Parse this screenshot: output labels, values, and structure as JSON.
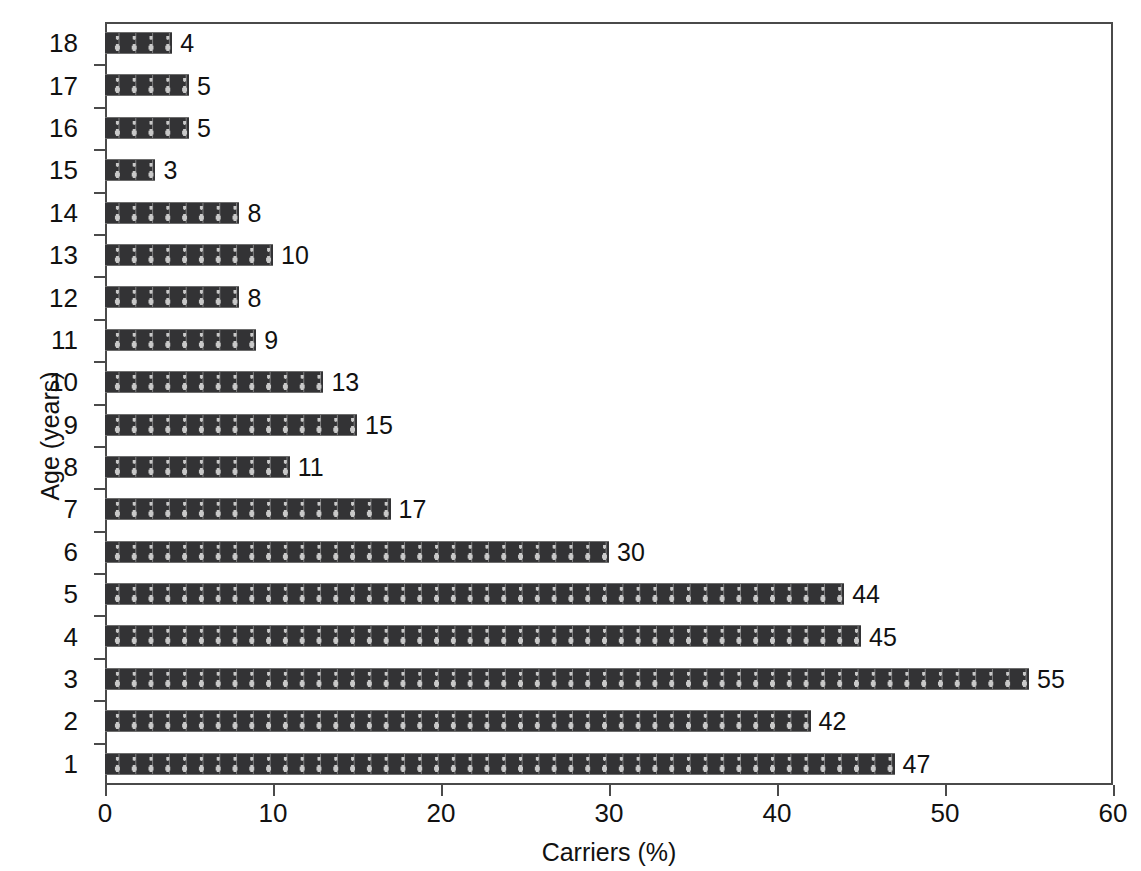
{
  "chart_data": {
    "type": "bar",
    "orientation": "horizontal",
    "title": "",
    "xlabel": "Carriers (%)",
    "ylabel": "Age (years)",
    "xlim": [
      0,
      60
    ],
    "xticks": [
      0,
      10,
      20,
      30,
      40,
      50,
      60
    ],
    "xtick_labels": [
      "0",
      "10",
      "20",
      "30",
      "40",
      "50",
      "60"
    ],
    "grid": false,
    "legend": null,
    "bar_fill_color": "#333335",
    "bar_pattern_color": "#c9c9c9",
    "bar_pattern_icon": "person-figure-icon",
    "axis_color": "#4a4a4a",
    "categories": [
      "18",
      "17",
      "16",
      "15",
      "14",
      "13",
      "12",
      "11",
      "10",
      "9",
      "8",
      "7",
      "6",
      "5",
      "4",
      "3",
      "2",
      "1"
    ],
    "values": [
      4,
      5,
      5,
      3,
      8,
      10,
      8,
      9,
      13,
      15,
      11,
      17,
      30,
      44,
      45,
      55,
      42,
      47
    ],
    "data_labels": [
      "4",
      "5",
      "5",
      "3",
      "8",
      "10",
      "8",
      "9",
      "13",
      "15",
      "11",
      "17",
      "30",
      "44",
      "45",
      "55",
      "42",
      "47"
    ],
    "points": [
      {
        "category": "18",
        "value": 4,
        "label": "4"
      },
      {
        "category": "17",
        "value": 5,
        "label": "5"
      },
      {
        "category": "16",
        "value": 5,
        "label": "5"
      },
      {
        "category": "15",
        "value": 3,
        "label": "3"
      },
      {
        "category": "14",
        "value": 8,
        "label": "8"
      },
      {
        "category": "13",
        "value": 10,
        "label": "10"
      },
      {
        "category": "12",
        "value": 8,
        "label": "8"
      },
      {
        "category": "11",
        "value": 9,
        "label": "9"
      },
      {
        "category": "10",
        "value": 13,
        "label": "13"
      },
      {
        "category": "9",
        "value": 15,
        "label": "15"
      },
      {
        "category": "8",
        "value": 11,
        "label": "11"
      },
      {
        "category": "7",
        "value": 17,
        "label": "17"
      },
      {
        "category": "6",
        "value": 30,
        "label": "30"
      },
      {
        "category": "5",
        "value": 44,
        "label": "44"
      },
      {
        "category": "4",
        "value": 45,
        "label": "45"
      },
      {
        "category": "3",
        "value": 55,
        "label": "55"
      },
      {
        "category": "2",
        "value": 42,
        "label": "42"
      },
      {
        "category": "1",
        "value": 47,
        "label": "47"
      }
    ]
  }
}
